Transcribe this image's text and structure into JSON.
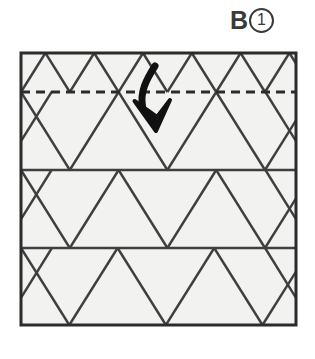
{
  "label": {
    "letter": "B",
    "step_number": "1",
    "icon": "circled-number"
  },
  "diagram": {
    "paper": {
      "shape": "square",
      "x": 21,
      "y": 53,
      "width": 275,
      "height": 272,
      "fill_color": "#f2f2f0",
      "border_color": "#2b2b2b",
      "border_width": 3
    },
    "grid": {
      "type": "triangular",
      "line_color": "#3f3f3f",
      "line_width": 2.4,
      "horizontal_lines_y": [
        92,
        170,
        248
      ],
      "row_boundaries_y": [
        53,
        92,
        170,
        248,
        325
      ],
      "vertex_columns_a": [
        21,
        118,
        215,
        312
      ],
      "vertex_columns_b": [
        70,
        167,
        264
      ],
      "columns_step": 48.7
    },
    "fold_line": {
      "kind": "valley-fold-dashed",
      "y": 92,
      "x_start": 21,
      "x_end": 296,
      "color": "#2b2b2b",
      "dash": "9 6",
      "width": 3
    },
    "arrow": {
      "kind": "fold-down-curved-arrow",
      "color": "#111111",
      "start_x": 155,
      "start_y": 66,
      "tip_x": 156,
      "tip_y": 131,
      "stroke_width": 7
    }
  }
}
